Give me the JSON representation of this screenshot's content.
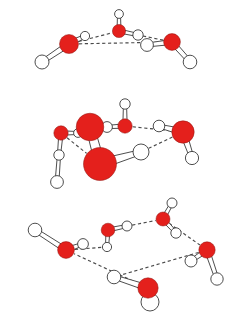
{
  "figure": {
    "background_color": "#ffffff",
    "oxygen_color": "#e4201c",
    "oxygen_outline_color": "#8c1410",
    "hydrogen_color": "#ffffff",
    "bond_color": "#3a3a3a",
    "hydrogen_bond_color": "#4a4a4a",
    "hydrogen_bond_style": "dashed",
    "atom_legend": [
      {
        "name": "oxygen",
        "symbol": "O",
        "color": "#e4201c"
      },
      {
        "name": "hydrogen",
        "symbol": "H",
        "color": "#ffffff"
      }
    ],
    "clusters": [
      {
        "name": "water-trimer",
        "label": "",
        "molecule_count": 3,
        "ring_size": 3,
        "atoms": [
          {
            "id": "O1",
            "element": "O",
            "x": 69,
            "y": 44,
            "r": 9.5
          },
          {
            "id": "H1a",
            "element": "H",
            "x": 42,
            "y": 62,
            "r": 7.0
          },
          {
            "id": "H1b",
            "element": "H",
            "x": 85,
            "y": 36,
            "r": 4.6
          },
          {
            "id": "O2",
            "element": "O",
            "x": 119,
            "y": 31,
            "r": 6.6
          },
          {
            "id": "H2a",
            "element": "H",
            "x": 119,
            "y": 14,
            "r": 4.4
          },
          {
            "id": "H2b",
            "element": "H",
            "x": 138,
            "y": 35,
            "r": 5.2
          },
          {
            "id": "O3",
            "element": "O",
            "x": 172,
            "y": 42,
            "r": 8.4
          },
          {
            "id": "H3a",
            "element": "H",
            "x": 147,
            "y": 45,
            "r": 6.4
          },
          {
            "id": "H3b",
            "element": "H",
            "x": 190,
            "y": 62,
            "r": 6.8
          }
        ],
        "covalent_bonds": [
          [
            "O1",
            "H1a"
          ],
          [
            "O1",
            "H1b"
          ],
          [
            "O2",
            "H2a"
          ],
          [
            "O2",
            "H2b"
          ],
          [
            "O3",
            "H3a"
          ],
          [
            "O3",
            "H3b"
          ]
        ],
        "hydrogen_bonds": [
          [
            "O1",
            "O2"
          ],
          [
            "O2",
            "O3"
          ],
          [
            "O1",
            "O3"
          ]
        ]
      },
      {
        "name": "water-pentamer",
        "label": "",
        "molecule_count": 5,
        "ring_size": 5,
        "atoms": [
          {
            "id": "O1",
            "element": "O",
            "x": 61,
            "y": 133,
            "r": 7.2
          },
          {
            "id": "H1a",
            "element": "H",
            "x": 59,
            "y": 155,
            "r": 5.2
          },
          {
            "id": "H1b",
            "element": "H",
            "x": 78,
            "y": 133,
            "r": 4.4
          },
          {
            "id": "H1c",
            "element": "H",
            "x": 57,
            "y": 182,
            "r": 6.4
          },
          {
            "id": "O2",
            "element": "O",
            "x": 90,
            "y": 127,
            "r": 13.8
          },
          {
            "id": "O3",
            "element": "O",
            "x": 125,
            "y": 126,
            "r": 7.2
          },
          {
            "id": "H3a",
            "element": "H",
            "x": 125,
            "y": 104,
            "r": 5.2
          },
          {
            "id": "H3b",
            "element": "H",
            "x": 107,
            "y": 127,
            "r": 5.4
          },
          {
            "id": "O4",
            "element": "O",
            "x": 183,
            "y": 132,
            "r": 11.2
          },
          {
            "id": "H4a",
            "element": "H",
            "x": 159,
            "y": 126,
            "r": 5.8
          },
          {
            "id": "H4b",
            "element": "H",
            "x": 192,
            "y": 158,
            "r": 6.6
          },
          {
            "id": "O5",
            "element": "O",
            "x": 100,
            "y": 164,
            "r": 16.5
          },
          {
            "id": "H5a",
            "element": "H",
            "x": 141,
            "y": 152,
            "r": 8.0
          }
        ],
        "covalent_bonds": [
          [
            "O1",
            "H1a"
          ],
          [
            "O1",
            "H1b"
          ],
          [
            "H1a",
            "H1c"
          ],
          [
            "O2",
            "H1b"
          ],
          [
            "O2",
            "O5"
          ],
          [
            "O3",
            "H3a"
          ],
          [
            "O3",
            "H3b"
          ],
          [
            "O4",
            "H4a"
          ],
          [
            "O4",
            "H4b"
          ],
          [
            "O5",
            "H5a"
          ]
        ],
        "hydrogen_bonds": [
          [
            "O3",
            "O4"
          ],
          [
            "O4",
            "H5a"
          ],
          [
            "O1",
            "O5"
          ],
          [
            "O2",
            "O3"
          ]
        ]
      },
      {
        "name": "water-hexamer",
        "label": "",
        "molecule_count": 6,
        "ring_size": 6,
        "atoms": [
          {
            "id": "O1",
            "element": "O",
            "x": 66,
            "y": 250,
            "r": 8.4
          },
          {
            "id": "H1a",
            "element": "H",
            "x": 35,
            "y": 230,
            "r": 6.8
          },
          {
            "id": "H1b",
            "element": "H",
            "x": 83,
            "y": 244,
            "r": 5.4
          },
          {
            "id": "O2",
            "element": "O",
            "x": 108,
            "y": 230,
            "r": 6.8
          },
          {
            "id": "H2a",
            "element": "H",
            "x": 107,
            "y": 247,
            "r": 4.6
          },
          {
            "id": "H2b",
            "element": "H",
            "x": 127,
            "y": 226,
            "r": 5.0
          },
          {
            "id": "O3",
            "element": "O",
            "x": 163,
            "y": 219,
            "r": 7.0
          },
          {
            "id": "H3a",
            "element": "H",
            "x": 172,
            "y": 203,
            "r": 5.0
          },
          {
            "id": "H3b",
            "element": "H",
            "x": 176,
            "y": 233,
            "r": 5.2
          },
          {
            "id": "O4",
            "element": "O",
            "x": 207,
            "y": 250,
            "r": 8.2
          },
          {
            "id": "H4a",
            "element": "H",
            "x": 191,
            "y": 261,
            "r": 6.0
          },
          {
            "id": "H4b",
            "element": "H",
            "x": 217,
            "y": 279,
            "r": 6.2
          },
          {
            "id": "O5",
            "element": "O",
            "x": 148,
            "y": 288,
            "r": 10.2
          },
          {
            "id": "H5a",
            "element": "H",
            "x": 114,
            "y": 277,
            "r": 6.8
          },
          {
            "id": "H5b",
            "element": "H",
            "x": 150,
            "y": 302,
            "r": 9.0
          }
        ],
        "covalent_bonds": [
          [
            "O1",
            "H1a"
          ],
          [
            "O1",
            "H1b"
          ],
          [
            "O2",
            "H2a"
          ],
          [
            "O2",
            "H2b"
          ],
          [
            "O3",
            "H3a"
          ],
          [
            "O3",
            "H3b"
          ],
          [
            "O4",
            "H4a"
          ],
          [
            "O4",
            "H4b"
          ],
          [
            "O5",
            "H5a"
          ],
          [
            "O5",
            "H5b"
          ]
        ],
        "hydrogen_bonds": [
          [
            "O1",
            "H2a"
          ],
          [
            "O2",
            "O3"
          ],
          [
            "O3",
            "O4"
          ],
          [
            "O4",
            "H5a"
          ],
          [
            "O5",
            "O1"
          ]
        ]
      }
    ]
  }
}
